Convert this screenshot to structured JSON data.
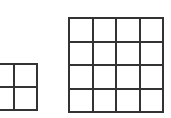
{
  "grids": [
    {
      "name": "small-grid",
      "rows": 2,
      "cols": 2,
      "x": -10,
      "y": 63,
      "cell": 24
    },
    {
      "name": "large-grid",
      "rows": 4,
      "cols": 4,
      "x": 68,
      "y": 17,
      "cell": 24
    }
  ],
  "line_color": "#333333"
}
